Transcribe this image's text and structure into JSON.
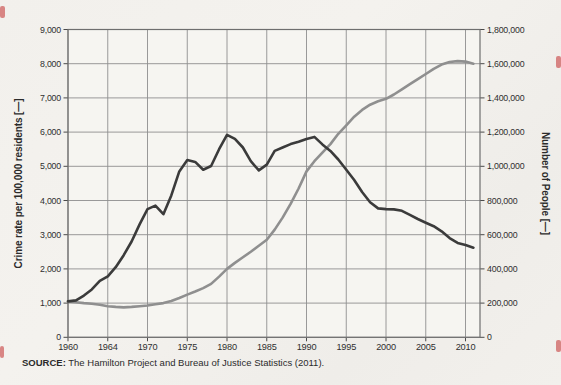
{
  "chart_data": {
    "type": "line",
    "title": "",
    "grid": true,
    "legend_position": "axis-label-brackets",
    "x": [
      1960,
      1961,
      1962,
      1963,
      1964,
      1965,
      1966,
      1967,
      1968,
      1969,
      1970,
      1971,
      1972,
      1973,
      1974,
      1975,
      1976,
      1977,
      1978,
      1979,
      1980,
      1981,
      1982,
      1983,
      1984,
      1985,
      1986,
      1987,
      1988,
      1989,
      1990,
      1991,
      1992,
      1993,
      1994,
      1995,
      1996,
      1997,
      1998,
      1999,
      2000,
      2001,
      2002,
      2003,
      2004,
      2005,
      2006,
      2007,
      2008,
      2009,
      2010,
      2011
    ],
    "series": [
      {
        "name": "Crime rate per 100,000 residents",
        "axis": "left",
        "color": "#3b3b3b",
        "values": [
          1050,
          1080,
          1220,
          1400,
          1650,
          1780,
          2050,
          2400,
          2800,
          3300,
          3750,
          3850,
          3600,
          4150,
          4850,
          5180,
          5130,
          4900,
          5010,
          5500,
          5920,
          5800,
          5550,
          5150,
          4880,
          5050,
          5450,
          5550,
          5650,
          5720,
          5800,
          5860,
          5640,
          5450,
          5200,
          4900,
          4600,
          4250,
          3950,
          3770,
          3750,
          3740,
          3700,
          3580,
          3460,
          3350,
          3250,
          3100,
          2900,
          2760,
          2700,
          2620
        ]
      },
      {
        "name": "Number of People",
        "axis": "right",
        "color": "#8f8f8f",
        "values": [
          210000,
          205000,
          200000,
          196000,
          190000,
          182000,
          178000,
          175000,
          178000,
          182000,
          186000,
          193000,
          200000,
          212000,
          230000,
          250000,
          268000,
          288000,
          312000,
          355000,
          400000,
          435000,
          468000,
          500000,
          535000,
          570000,
          630000,
          700000,
          780000,
          870000,
          970000,
          1030000,
          1080000,
          1130000,
          1190000,
          1240000,
          1290000,
          1330000,
          1360000,
          1380000,
          1395000,
          1420000,
          1450000,
          1480000,
          1510000,
          1540000,
          1570000,
          1595000,
          1610000,
          1615000,
          1612000,
          1600000
        ]
      }
    ],
    "left_axis": {
      "label": "Crime rate per 100,000 residents [—]",
      "min": 0,
      "max": 9000,
      "step": 1000,
      "ticks": [
        "9,000",
        "8,000",
        "7,000",
        "6,000",
        "5,000",
        "4,000",
        "3,000",
        "2,000",
        "1,000",
        "0"
      ]
    },
    "right_axis": {
      "label": "Number of People [—]",
      "min": 0,
      "max": 1800000,
      "step": 200000,
      "ticks": [
        "1,800,000",
        "1,600,000",
        "1,400,000",
        "1,200,000",
        "1,000,000",
        "800,000",
        "600,000",
        "400,000",
        "200,000",
        "0"
      ]
    },
    "x_axis": {
      "tick_labels": [
        "1960",
        "1964",
        "1970",
        "1975",
        "1980",
        "1985",
        "1990",
        "1995",
        "2000",
        "2005",
        "2010"
      ]
    },
    "source": {
      "label": "SOURCE:",
      "text": " The Hamilton Project and Bureau of Justice Statistics (2011)."
    }
  }
}
